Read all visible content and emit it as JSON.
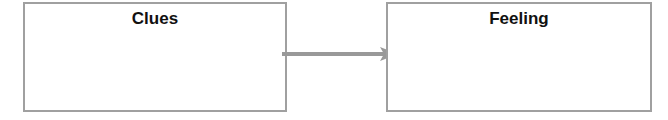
{
  "diagram": {
    "boxes": [
      {
        "title": "Clues"
      },
      {
        "title": "Feeling"
      }
    ],
    "connector": {
      "from": "Clues",
      "to": "Feeling",
      "color": "#999999"
    },
    "colors": {
      "border": "#a0a0a0",
      "arrow": "#999999",
      "text": "#111111"
    }
  }
}
